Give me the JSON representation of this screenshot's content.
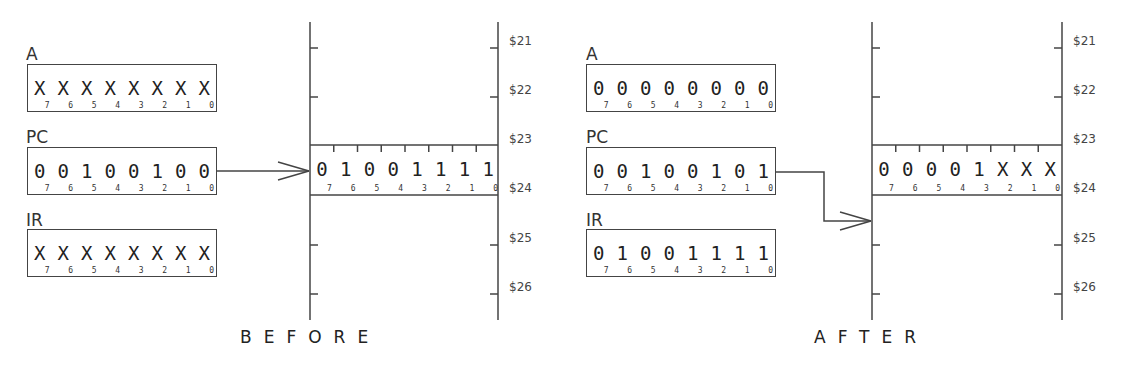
{
  "bit_indices": [
    "7",
    "6",
    "5",
    "4",
    "3",
    "2",
    "1",
    "0"
  ],
  "before": {
    "title": "BEFORE",
    "registers": [
      {
        "name": "A",
        "bits": [
          "X",
          "X",
          "X",
          "X",
          "X",
          "X",
          "X",
          "X"
        ]
      },
      {
        "name": "PC",
        "bits": [
          "0",
          "0",
          "1",
          "0",
          "0",
          "1",
          "0",
          "0"
        ]
      },
      {
        "name": "IR",
        "bits": [
          "X",
          "X",
          "X",
          "X",
          "X",
          "X",
          "X",
          "X"
        ]
      }
    ],
    "memory": {
      "addresses": [
        "$21",
        "$22",
        "$23",
        "$24",
        "$25",
        "$26"
      ],
      "highlighted_cell": {
        "address": "$24",
        "bits": [
          "0",
          "1",
          "0",
          "0",
          "1",
          "1",
          "1",
          "1"
        ]
      }
    },
    "arrow": {
      "from": "PC",
      "to": "$24"
    }
  },
  "after": {
    "title": "AFTER",
    "registers": [
      {
        "name": "A",
        "bits": [
          "0",
          "0",
          "0",
          "0",
          "0",
          "0",
          "0",
          "0"
        ]
      },
      {
        "name": "PC",
        "bits": [
          "0",
          "0",
          "1",
          "0",
          "0",
          "1",
          "0",
          "1"
        ]
      },
      {
        "name": "IR",
        "bits": [
          "0",
          "1",
          "0",
          "0",
          "1",
          "1",
          "1",
          "1"
        ]
      }
    ],
    "memory": {
      "addresses": [
        "$21",
        "$22",
        "$23",
        "$24",
        "$25",
        "$26"
      ],
      "highlighted_cell": {
        "address": "$24",
        "bits": [
          "0",
          "0",
          "0",
          "0",
          "1",
          "X",
          "X",
          "X"
        ]
      }
    },
    "arrow": {
      "from": "PC",
      "to": "$25"
    }
  }
}
